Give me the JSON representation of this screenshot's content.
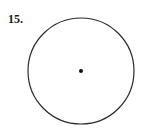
{
  "problem": {
    "number_label": "15."
  },
  "figure": {
    "type": "circle-with-center-point",
    "circle": {
      "cx": 81,
      "cy": 71,
      "r": 53,
      "stroke": "#2a2a2a",
      "stroke_width": 1.2
    },
    "center_point": {
      "cx": 81,
      "cy": 71,
      "r": 2,
      "fill": "#111111"
    }
  }
}
